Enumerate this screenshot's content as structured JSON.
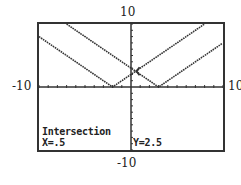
{
  "chart_data": {
    "type": "line",
    "title": "",
    "xlabel": "",
    "ylabel": "",
    "xlim": [
      -10,
      10
    ],
    "ylim": [
      -10,
      10
    ],
    "xscl": 1,
    "yscl": 1,
    "grid": false,
    "series": [
      {
        "name": "Y1",
        "expression": "abs(x+2)",
        "vertex": [
          -2,
          0
        ]
      },
      {
        "name": "Y2",
        "expression": "abs(x-3)",
        "vertex": [
          3,
          0
        ]
      }
    ],
    "annotations": {
      "mode": "Intersection",
      "x": 0.5,
      "y": 2.5
    }
  },
  "window": {
    "xmin_label": "-10",
    "xmax_label": "10",
    "ymax_label": "10",
    "ymin_label": "-10"
  },
  "readout": {
    "title": "Intersection",
    "x_text": "X=.5",
    "y_text": "Y=2.5"
  },
  "colors": {
    "plot": "#333333",
    "background": "#ffffff"
  }
}
